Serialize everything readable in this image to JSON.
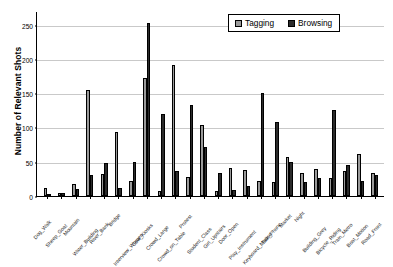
{
  "chart_data": {
    "type": "bar",
    "title": "",
    "xlabel": "",
    "ylabel": "Number of Relevant Shots",
    "ylim": [
      0,
      270
    ],
    "yticks": [
      0,
      50,
      100,
      150,
      200,
      250
    ],
    "grid": true,
    "legend_position": "top-right",
    "categories": [
      "Dog_Walk",
      "Sheep_Goat",
      "Mountain",
      "Water_Building",
      "River_Bank",
      "Bridge",
      "Interview_Women",
      "Cow_Kiosks",
      "Crowd_Large",
      "Crowd_on_Table",
      "Protest",
      "Student_Class",
      "Girl_Upstairs",
      "Door_Open",
      "Play_Instrument",
      "Keyboard_Mouse",
      "Talk_Phone",
      "Market",
      "Night",
      "Building_Grey",
      "Bicycle_Riding",
      "Train_Metro",
      "Boat_Motion",
      "Road_Front"
    ],
    "series": [
      {
        "name": "Tagging",
        "color": "#9a9a9a",
        "values": [
          12,
          5,
          17,
          154,
          32,
          94,
          22,
          172,
          8,
          191,
          28,
          103,
          8,
          41,
          38,
          22,
          21,
          57,
          34,
          39,
          27,
          37,
          62,
          33
        ]
      },
      {
        "name": "Browsing",
        "color": "#2b2b2b",
        "values": [
          3,
          4,
          10,
          30,
          48,
          12,
          50,
          253,
          119,
          36,
          133,
          72,
          34,
          9,
          14,
          150,
          108,
          50,
          21,
          26,
          125,
          45,
          22,
          30
        ]
      }
    ]
  },
  "legend": {
    "items": [
      {
        "label": "Tagging"
      },
      {
        "label": "Browsing"
      }
    ]
  },
  "axes": {
    "y_title": "Number of Relevant Shots"
  }
}
